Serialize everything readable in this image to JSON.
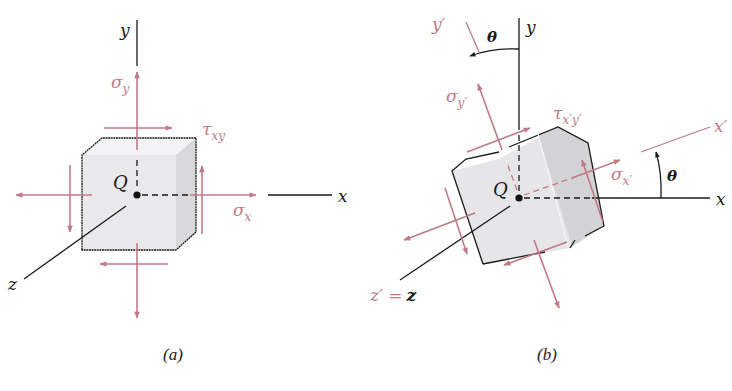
{
  "figure": {
    "colors": {
      "axis": "#1a1a1a",
      "stress": "#c07a86",
      "face_front": "#e9e8ea",
      "face_side": "#d6d5d8",
      "face_top": "#f3f2f4"
    },
    "panel_a": {
      "caption": "(a)",
      "axes": {
        "x": "x",
        "y": "y",
        "z": "z"
      },
      "point": "Q",
      "labels": {
        "sigma_y": "σ",
        "sigma_y_sub": "y",
        "sigma_x": "σ",
        "sigma_x_sub": "x",
        "tau": "τ",
        "tau_sub": "xy"
      }
    },
    "panel_b": {
      "caption": "(b)",
      "axes": {
        "x": "x",
        "y": "y",
        "x_prime": "x′",
        "y_prime": "y′",
        "z_eq": "z′ = z",
        "z_prime_part": "z′ =",
        "z_part": "z"
      },
      "point": "Q",
      "angle": "θ",
      "labels": {
        "sigma_y": "σ",
        "sigma_y_sub": "y′",
        "sigma_x": "σ",
        "sigma_x_sub": "x′",
        "tau": "τ",
        "tau_sub": "x′y′"
      }
    }
  }
}
